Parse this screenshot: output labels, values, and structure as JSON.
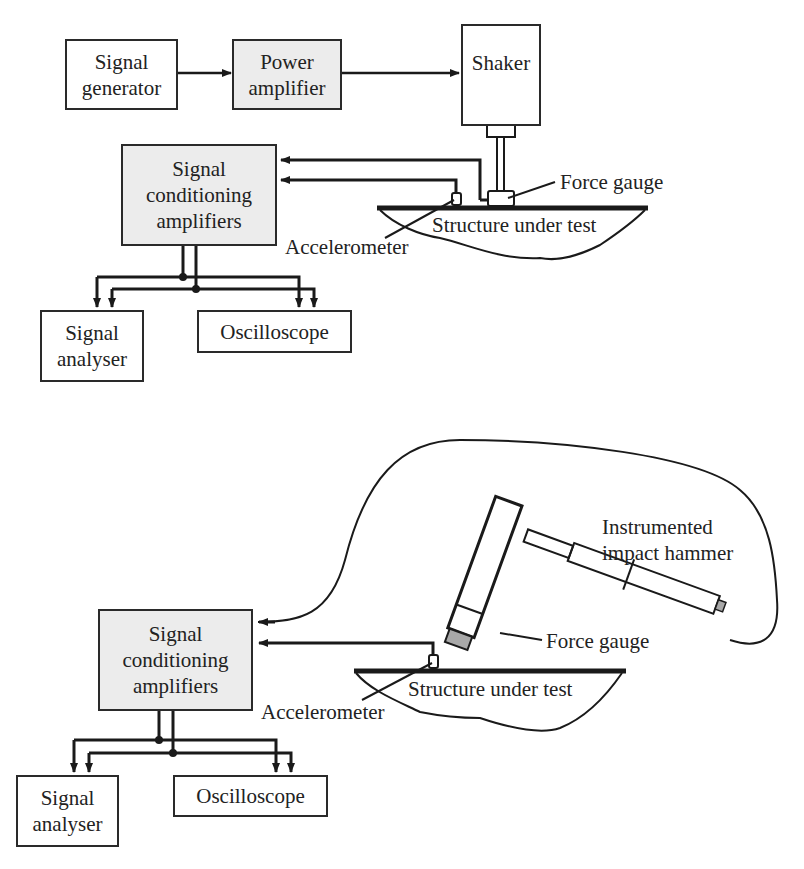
{
  "colors": {
    "line": "#1a1a1a",
    "grey_fill": "#ececec",
    "tip_fill": "#a8a8a8",
    "background": "#ffffff"
  },
  "top_diagram": {
    "signal_generator": [
      "Signal",
      "generator"
    ],
    "power_amplifier": [
      "Power",
      "amplifier"
    ],
    "shaker": "Shaker",
    "signal_conditioning": [
      "Signal",
      "conditioning",
      "amplifiers"
    ],
    "force_gauge": "Force gauge",
    "structure": "Structure under test",
    "accelerometer": "Accelerometer",
    "signal_analyser": [
      "Signal",
      "analyser"
    ],
    "oscilloscope": "Oscilloscope"
  },
  "bottom_diagram": {
    "hammer": [
      "Instrumented",
      "impact hammer"
    ],
    "force_gauge": "Force gauge",
    "signal_conditioning": [
      "Signal",
      "conditioning",
      "amplifiers"
    ],
    "structure": "Structure under test",
    "accelerometer": "Accelerometer",
    "signal_analyser": [
      "Signal",
      "analyser"
    ],
    "oscilloscope": "Oscilloscope"
  }
}
